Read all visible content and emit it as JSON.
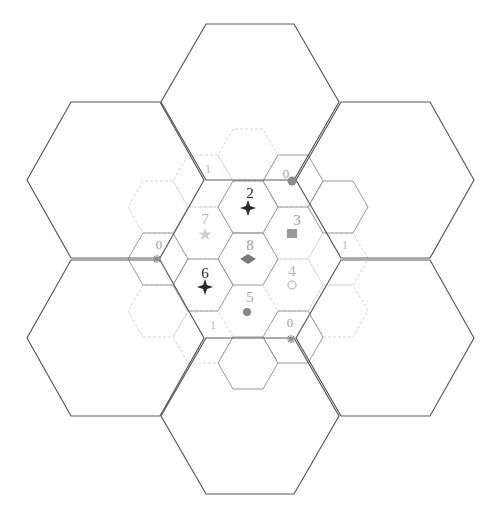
{
  "diagram": {
    "colors": {
      "large_hex_stroke": "#5a5a5a",
      "small_hex_dark_stroke": "#8a8a8a",
      "small_hex_light_stroke": "#d4d4d4",
      "label_dark": "#2a2a2a",
      "label_mid": "#8c8c8c",
      "label_light": "#b5b5b5"
    },
    "large_hexagons": [
      {
        "id": "top",
        "cx": 250,
        "cy": 102
      },
      {
        "id": "upper-left",
        "cx": 115,
        "cy": 180
      },
      {
        "id": "upper-right",
        "cx": 385,
        "cy": 180
      },
      {
        "id": "lower-left",
        "cx": 115,
        "cy": 338
      },
      {
        "id": "lower-right",
        "cx": 385,
        "cy": 338
      },
      {
        "id": "bottom",
        "cx": 250,
        "cy": 416
      }
    ],
    "inner_cells": [
      {
        "label": "2",
        "cx": 248,
        "cy": 207,
        "marker": "four-point-star",
        "tone": "dark"
      },
      {
        "label": "3",
        "cx": 293,
        "cy": 233,
        "marker": "checkered-square",
        "tone": "mid"
      },
      {
        "label": "4",
        "cx": 293,
        "cy": 285,
        "marker": "grid-circle",
        "tone": "light"
      },
      {
        "label": "5",
        "cx": 248,
        "cy": 311,
        "marker": "filled-circle",
        "tone": "mid"
      },
      {
        "label": "6",
        "cx": 203,
        "cy": 285,
        "marker": "four-point-star",
        "tone": "dark"
      },
      {
        "label": "7",
        "cx": 203,
        "cy": 233,
        "marker": "five-point-star",
        "tone": "light"
      },
      {
        "label": "8",
        "cx": 248,
        "cy": 259,
        "marker": "diamond",
        "tone": "mid"
      }
    ],
    "outer_labels": [
      {
        "label": "1",
        "x": 208,
        "y": 168,
        "tone": "light"
      },
      {
        "label": "0",
        "x": 287,
        "y": 176,
        "tone": "mid"
      },
      {
        "label": "0",
        "x": 159,
        "y": 244,
        "tone": "mid"
      },
      {
        "label": "1",
        "x": 344,
        "y": 246,
        "tone": "light"
      },
      {
        "label": "1",
        "x": 213,
        "y": 326,
        "tone": "light"
      },
      {
        "label": "0",
        "x": 290,
        "y": 323,
        "tone": "mid"
      }
    ],
    "junction_markers": [
      {
        "type": "filled-circle",
        "x": 292,
        "y": 181
      },
      {
        "type": "asterisk",
        "x": 157,
        "y": 259
      },
      {
        "type": "asterisk",
        "x": 291,
        "y": 339
      }
    ]
  }
}
